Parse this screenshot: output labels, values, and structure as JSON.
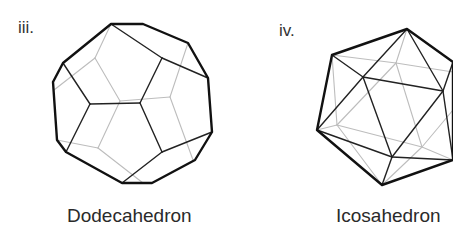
{
  "figures": [
    {
      "label": "iii.",
      "caption": "Dodecahedron",
      "front_color": "#222222",
      "back_color": "#bdbdbd",
      "outline": [
        [
          111,
          24
        ],
        [
          143,
          24
        ],
        [
          188,
          43
        ],
        [
          208,
          78
        ],
        [
          212,
          132
        ],
        [
          195,
          160
        ],
        [
          152,
          183
        ],
        [
          122,
          183
        ],
        [
          66,
          152
        ],
        [
          57,
          140
        ],
        [
          53,
          82
        ],
        [
          63,
          63
        ]
      ],
      "front_edges": [
        [
          [
            111,
            24
          ],
          [
            162,
            58
          ]
        ],
        [
          [
            162,
            58
          ],
          [
            208,
            78
          ]
        ],
        [
          [
            162,
            58
          ],
          [
            140,
            103
          ]
        ],
        [
          [
            140,
            103
          ],
          [
            90,
            104
          ]
        ],
        [
          [
            90,
            104
          ],
          [
            63,
            63
          ]
        ],
        [
          [
            90,
            104
          ],
          [
            66,
            152
          ]
        ],
        [
          [
            140,
            103
          ],
          [
            162,
            152
          ]
        ],
        [
          [
            162,
            152
          ],
          [
            212,
            132
          ]
        ],
        [
          [
            162,
            152
          ],
          [
            122,
            183
          ]
        ]
      ],
      "back_edges": [
        [
          [
            111,
            24
          ],
          [
            95,
            58
          ]
        ],
        [
          [
            95,
            58
          ],
          [
            54,
            90
          ]
        ],
        [
          [
            95,
            58
          ],
          [
            120,
            101
          ]
        ],
        [
          [
            120,
            101
          ],
          [
            98,
            148
          ]
        ],
        [
          [
            98,
            148
          ],
          [
            57,
            140
          ]
        ],
        [
          [
            98,
            148
          ],
          [
            143,
            183
          ]
        ],
        [
          [
            188,
            43
          ],
          [
            170,
            97
          ]
        ],
        [
          [
            170,
            97
          ],
          [
            120,
            101
          ]
        ],
        [
          [
            170,
            97
          ],
          [
            193,
            160
          ]
        ]
      ]
    },
    {
      "label": "iv.",
      "caption": "Icosahedron",
      "front_color": "#222222",
      "back_color": "#bdbdbd",
      "outline": [
        [
          407,
          29
        ],
        [
          453,
          62
        ],
        [
          453,
          160
        ],
        [
          382,
          185
        ],
        [
          317,
          130
        ],
        [
          332,
          55
        ]
      ],
      "front_edges": [
        [
          [
            407,
            29
          ],
          [
            363,
            77
          ]
        ],
        [
          [
            407,
            29
          ],
          [
            443,
            91
          ]
        ],
        [
          [
            332,
            55
          ],
          [
            363,
            77
          ]
        ],
        [
          [
            363,
            77
          ],
          [
            443,
            91
          ]
        ],
        [
          [
            363,
            77
          ],
          [
            317,
            130
          ]
        ],
        [
          [
            363,
            77
          ],
          [
            392,
            157
          ]
        ],
        [
          [
            443,
            91
          ],
          [
            392,
            157
          ]
        ],
        [
          [
            443,
            91
          ],
          [
            453,
            62
          ]
        ],
        [
          [
            443,
            91
          ],
          [
            453,
            160
          ]
        ],
        [
          [
            317,
            130
          ],
          [
            392,
            157
          ]
        ],
        [
          [
            392,
            157
          ],
          [
            382,
            185
          ]
        ],
        [
          [
            392,
            157
          ],
          [
            453,
            160
          ]
        ]
      ],
      "back_edges": [
        [
          [
            407,
            29
          ],
          [
            396,
            63
          ]
        ],
        [
          [
            332,
            55
          ],
          [
            396,
            63
          ]
        ],
        [
          [
            396,
            63
          ],
          [
            453,
            72
          ]
        ],
        [
          [
            396,
            63
          ],
          [
            337,
            125
          ]
        ],
        [
          [
            396,
            63
          ],
          [
            422,
            147
          ]
        ],
        [
          [
            332,
            55
          ],
          [
            337,
            125
          ]
        ],
        [
          [
            317,
            130
          ],
          [
            337,
            125
          ]
        ],
        [
          [
            337,
            125
          ],
          [
            422,
            147
          ]
        ],
        [
          [
            337,
            125
          ],
          [
            382,
            185
          ]
        ],
        [
          [
            422,
            147
          ],
          [
            382,
            185
          ]
        ],
        [
          [
            422,
            147
          ],
          [
            453,
            160
          ]
        ],
        [
          [
            422,
            147
          ],
          [
            453,
            110
          ]
        ]
      ]
    }
  ]
}
